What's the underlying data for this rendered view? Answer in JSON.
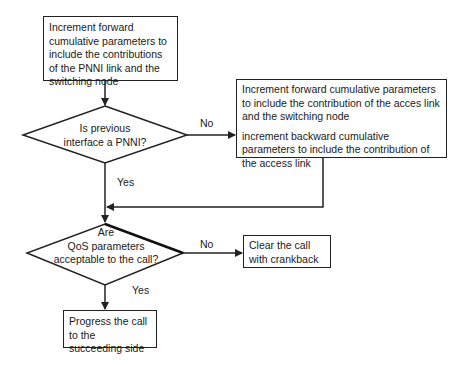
{
  "diagram": {
    "type": "flowchart",
    "nodes": {
      "increment_pnni": {
        "shape": "process",
        "text": "Increment forward cumulative parameters to include the contributions of the PNNI link and the switching node"
      },
      "is_previous_pnni": {
        "shape": "decision",
        "line1": "Is previous",
        "line2": "interface a PNNI?"
      },
      "increment_access": {
        "shape": "process",
        "para1": "Increment forward cumulative parameters  to include the contribution of the acces link and the switching node",
        "para2": "increment backward cumulative parameters to include the contribution of the access link"
      },
      "qos_acceptable": {
        "shape": "decision",
        "line1": "Are",
        "line2": "QoS parameters",
        "line3": "acceptable to the call?"
      },
      "clear_call": {
        "shape": "process",
        "text": "Clear the call with crankback"
      },
      "progress_call": {
        "shape": "process",
        "text": "Progress the call to the succeeding side"
      }
    },
    "edge_labels": {
      "pnni_no": "No",
      "pnni_yes": "Yes",
      "qos_no": "No",
      "qos_yes": "Yes"
    },
    "edges": [
      {
        "from": "increment_pnni",
        "to": "is_previous_pnni"
      },
      {
        "from": "is_previous_pnni",
        "to": "increment_access",
        "label": "No"
      },
      {
        "from": "is_previous_pnni",
        "to": "qos_acceptable",
        "label": "Yes"
      },
      {
        "from": "increment_access",
        "to": "qos_acceptable"
      },
      {
        "from": "qos_acceptable",
        "to": "clear_call",
        "label": "No"
      },
      {
        "from": "qos_acceptable",
        "to": "progress_call",
        "label": "Yes"
      }
    ]
  }
}
